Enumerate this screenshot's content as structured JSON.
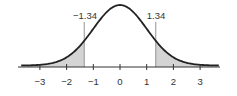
{
  "chart_data": {
    "type": "area",
    "title": "",
    "xlabel": "",
    "ylabel": "",
    "xlim": [
      -3.7,
      3.7
    ],
    "xticks": [
      -3,
      -2,
      -1,
      0,
      1,
      2,
      3
    ],
    "xtick_labels": [
      "−3",
      "−2",
      "−1",
      "0",
      "1",
      "2",
      "3"
    ],
    "curve": "standard normal pdf",
    "mean": 0,
    "sd": 1,
    "cutoffs": [
      -1.34,
      1.34
    ],
    "annotations": [
      {
        "text": "−1.34",
        "x": -1.34
      },
      {
        "text": "1.34",
        "x": 1.34
      }
    ],
    "shaded_regions": [
      {
        "from": -3.7,
        "to": -1.34
      },
      {
        "from": 1.34,
        "to": 3.7
      }
    ],
    "grid": false,
    "legend": null
  },
  "labels": {
    "left_cut": "−1.34",
    "right_cut": "1.34",
    "ticks": [
      "−3",
      "−2",
      "−1",
      "0",
      "1",
      "2",
      "3"
    ]
  },
  "colors": {
    "curve": "#222222",
    "shade": "#d4d4d4",
    "axis": "#333333",
    "cut_line": "#888888"
  }
}
